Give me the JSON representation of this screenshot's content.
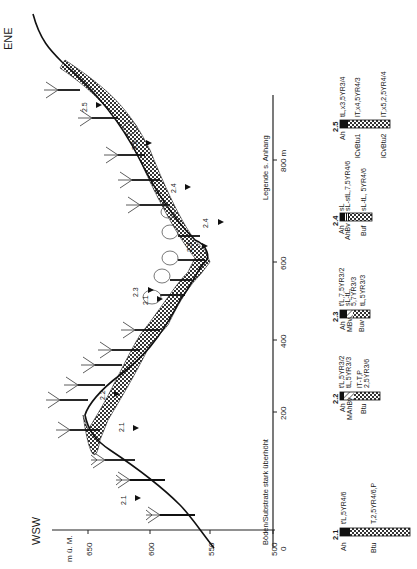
{
  "figure": {
    "direction_left": "WSW",
    "direction_right": "ENE",
    "elevation_axis": {
      "unit_label": "m ü. M.",
      "ticks": [
        {
          "label": "650",
          "value": 650
        },
        {
          "label": "600",
          "value": 600
        },
        {
          "label": "550",
          "value": 550
        },
        {
          "label": "500",
          "value": 500
        }
      ]
    },
    "distance_axis": {
      "ticks": [
        {
          "label": "0",
          "value": 0
        },
        {
          "label": "200",
          "value": 200
        },
        {
          "label": "400",
          "value": 400
        },
        {
          "label": "600",
          "value": 600
        },
        {
          "label": "800 m",
          "value": 800
        }
      ]
    },
    "note_exaggeration": "Böden/Substrate stark überhöht",
    "note_legend": "Legende s. Anhang",
    "profile_markers": [
      {
        "label": "2.1",
        "x": 135,
        "y": 500
      },
      {
        "label": "2.1",
        "x": 150,
        "y": 425
      },
      {
        "label": "2.2",
        "x": 174,
        "y": 370
      },
      {
        "label": "2.1",
        "x": 192,
        "y": 300
      },
      {
        "label": "2.3",
        "x": 160,
        "y": 290
      },
      {
        "label": "2.3",
        "x": 190,
        "y": 250
      },
      {
        "label": "2.4",
        "x": 196,
        "y": 215
      },
      {
        "label": "2.4",
        "x": 160,
        "y": 185
      },
      {
        "label": "2.5",
        "x": 136,
        "y": 140
      },
      {
        "label": "2.5",
        "x": 100,
        "y": 100
      }
    ],
    "soil_profiles": [
      {
        "id": "2.1",
        "horizons": [
          {
            "name": "Ah",
            "desc": "t'L,5YR4/6"
          },
          {
            "name": "Btu",
            "desc": "T,2,5YR4/6,P"
          }
        ]
      },
      {
        "id": "2.2",
        "horizons": [
          {
            "name": "Ah",
            "desc": "t'L,5YR3/2"
          },
          {
            "name": "MAhBv",
            "desc": "tL,5YR3/3"
          },
          {
            "name": "Btu",
            "desc": "lT-T,P 2,5YR3/6"
          }
        ]
      },
      {
        "id": "2.3",
        "horizons": [
          {
            "name": "Ah",
            "desc": "t'L,7,5YR3/2"
          },
          {
            "name": "MBv",
            "desc": "sL-tL, 5,7YR3/3"
          },
          {
            "name": "Buv",
            "desc": "tL,5YR3/3"
          }
        ]
      },
      {
        "id": "2.4",
        "horizons": [
          {
            "name": "Ah",
            "desc": "sL"
          },
          {
            "name": "AhBv",
            "desc": "sL-stL,7,5YR4/6"
          },
          {
            "name": "Buf",
            "desc": "sL-tL, 5YR4/6"
          }
        ]
      },
      {
        "id": "2.5",
        "horizons": [
          {
            "name": "Ah",
            "desc": "tL,x3,5YR3/4"
          },
          {
            "name": "lCvBtu1",
            "desc": "lT,x4,5YR4/3"
          },
          {
            "name": "lCvBtu2",
            "desc": "lT,x5,2,5YR4/4"
          }
        ]
      }
    ]
  }
}
